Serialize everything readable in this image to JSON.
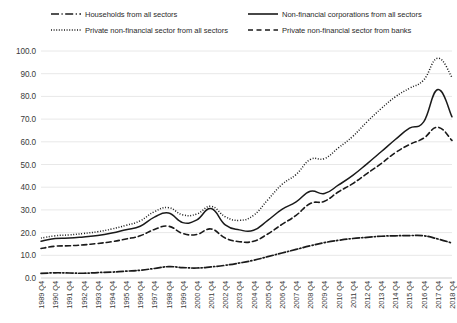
{
  "chart_data": {
    "type": "line",
    "title": "",
    "subtitle": "",
    "xlabel": "",
    "ylabel": "",
    "ylim": [
      0.0,
      100.0
    ],
    "ytick_step": 10.0,
    "grid": true,
    "grid_axis": "y",
    "legend_position": "top",
    "line_color": "#1a1a1a",
    "grid_color": "#e8e8e8",
    "text_color": "#3a3a3a",
    "ytick_labels": [
      "100.0",
      "90.0",
      "80.0",
      "70.0",
      "60.0",
      "50.0",
      "40.0",
      "30.0",
      "20.0",
      "10.0",
      "0.0"
    ],
    "categories": [
      "1989 Q4",
      "1990 Q4",
      "1991 Q4",
      "1992 Q4",
      "1993 Q4",
      "1994 Q4",
      "1995 Q4",
      "1996 Q4",
      "1997 Q4",
      "1998 Q4",
      "1999 Q4",
      "2000 Q4",
      "2001 Q4",
      "2002 Q4",
      "2003 Q4",
      "2004 Q4",
      "2005 Q4",
      "2006 Q4",
      "2007 Q4",
      "2008 Q4",
      "2009 Q4",
      "2010 Q4",
      "2011 Q4",
      "2012 Q4",
      "2013 Q4",
      "2014 Q4",
      "2015 Q4",
      "2016 Q4",
      "2017 Q4",
      "2018 Q4"
    ],
    "series": [
      {
        "name": "Households from all sectors",
        "style": "dashdot",
        "legend_key": "households",
        "values": [
          2.0,
          2.3,
          2.2,
          2.1,
          2.4,
          2.6,
          3.0,
          3.4,
          4.2,
          5.0,
          4.6,
          4.4,
          4.9,
          5.6,
          6.6,
          7.8,
          9.4,
          11.0,
          12.6,
          14.2,
          15.6,
          16.6,
          17.4,
          17.9,
          18.4,
          18.6,
          18.7,
          18.6,
          17.2,
          15.4
        ]
      },
      {
        "name": "Non-financial corporations from all sectors",
        "style": "solid",
        "legend_key": "nfc",
        "values": [
          16.2,
          17.4,
          17.6,
          18.1,
          18.7,
          19.8,
          21.3,
          22.8,
          26.8,
          28.6,
          24.4,
          25.6,
          30.6,
          23.4,
          21.2,
          21.0,
          25.4,
          30.2,
          33.5,
          38.2,
          37.2,
          41.0,
          45.2,
          50.3,
          55.6,
          61.0,
          66.0,
          68.8,
          83.0,
          71.0
        ]
      },
      {
        "name": "Private non-financial sector from all sectors",
        "style": "dotted",
        "legend_key": "pnfs_all",
        "values": [
          17.6,
          18.6,
          19.0,
          19.6,
          20.4,
          21.6,
          23.2,
          25.2,
          29.2,
          31.0,
          27.8,
          28.2,
          31.6,
          27.0,
          25.4,
          27.6,
          34.4,
          41.2,
          45.6,
          52.2,
          52.6,
          57.4,
          62.4,
          68.8,
          74.6,
          79.8,
          83.6,
          87.2,
          96.8,
          88.4
        ]
      },
      {
        "name": "Private non-financial sector from banks",
        "style": "dashed",
        "legend_key": "pnfs_banks",
        "values": [
          13.0,
          14.0,
          14.2,
          14.6,
          15.2,
          16.0,
          17.2,
          18.6,
          21.4,
          22.8,
          19.6,
          19.2,
          21.6,
          17.6,
          16.0,
          16.2,
          19.4,
          23.6,
          27.6,
          32.8,
          33.8,
          38.0,
          41.6,
          46.0,
          50.4,
          55.2,
          58.8,
          61.6,
          66.4,
          60.6
        ]
      }
    ]
  },
  "legend": {
    "entries": [
      {
        "label": "Households from all sectors",
        "style": "dashdot"
      },
      {
        "label": "Non-financial corporations from all sectors",
        "style": "solid"
      },
      {
        "label": "Private non-financial sector from all sectors",
        "style": "dotted"
      },
      {
        "label": "Private non-financial sector from banks",
        "style": "dashed"
      }
    ]
  }
}
